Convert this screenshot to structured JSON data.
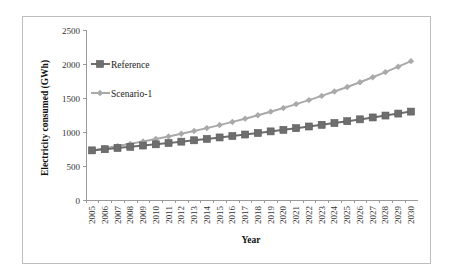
{
  "chart_data": {
    "type": "line",
    "title": "",
    "xlabel": "Year",
    "ylabel": "Electricity consumed (GWh)",
    "ylim": [
      0,
      2500
    ],
    "yticks": [
      0,
      500,
      1000,
      1500,
      2000,
      2500
    ],
    "grid": false,
    "legend_position": "upper-left inside plot",
    "x": [
      "2005",
      "2006",
      "2007",
      "2008",
      "2009",
      "2010",
      "2011",
      "2012",
      "2013",
      "2014",
      "2015",
      "2016",
      "2017",
      "2018",
      "2019",
      "2020",
      "2021",
      "2022",
      "2023",
      "2024",
      "2025",
      "2026",
      "2027",
      "2028",
      "2029",
      "2030"
    ],
    "series": [
      {
        "name": "Reference",
        "marker": "square",
        "color": "#6e6e6e",
        "values": [
          730,
          747,
          765,
          782,
          801,
          819,
          838,
          858,
          878,
          899,
          920,
          941,
          963,
          986,
          1009,
          1032,
          1056,
          1081,
          1106,
          1132,
          1159,
          1186,
          1214,
          1242,
          1271,
          1300
        ]
      },
      {
        "name": "Scenario-1",
        "marker": "diamond",
        "color": "#a9a9a9",
        "values": [
          730,
          761,
          793,
          826,
          861,
          897,
          934,
          974,
          1015,
          1057,
          1102,
          1148,
          1196,
          1246,
          1299,
          1353,
          1410,
          1469,
          1531,
          1595,
          1662,
          1732,
          1805,
          1881,
          1960,
          2042
        ]
      }
    ]
  }
}
